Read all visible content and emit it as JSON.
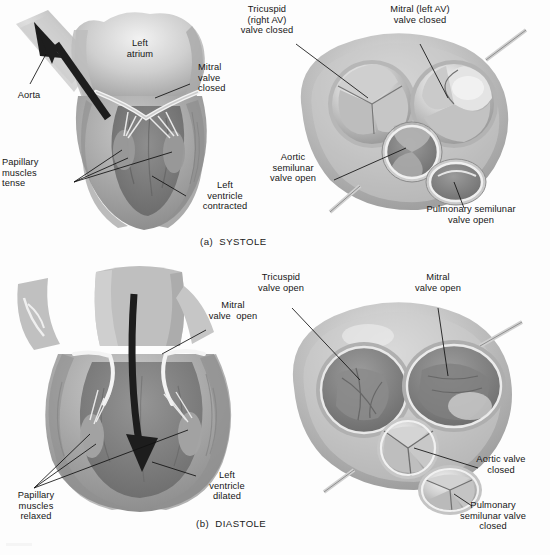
{
  "figure": {
    "title_alt": "Cardiac cycle: systole and diastole with heart valve views",
    "background_color": "#fdfdfd",
    "ink_color": "#161616",
    "tissue_mid": "#9a9a9a",
    "tissue_light": "#d8d8d8",
    "tissue_dark": "#6d6d6d",
    "arrow_color": "#1d1d1d"
  },
  "panels": [
    {
      "id": "systole-longitudinal",
      "caption": "(a)  SYSTOLE",
      "view": "longitudinal-section",
      "labels": [
        {
          "name": "aorta",
          "text": "Aorta"
        },
        {
          "name": "left-atrium",
          "text": "Left\natrium"
        },
        {
          "name": "mitral-valve",
          "text": "Mitral\nvalve\nclosed"
        },
        {
          "name": "papillary-muscles",
          "text": "Papillary\nmuscles\ntense"
        },
        {
          "name": "left-ventricle",
          "text": "Left\nventricle\ncontracted"
        }
      ]
    },
    {
      "id": "systole-valves",
      "view": "superior-valve-section",
      "labels": [
        {
          "name": "tricuspid-valve",
          "text": "Tricuspid\n(right AV)\nvalve closed"
        },
        {
          "name": "mitral-valve",
          "text": "Mitral (left AV)\nvalve closed"
        },
        {
          "name": "aortic-valve",
          "text": "Aortic\nsemilunar\nvalve open"
        },
        {
          "name": "pulmonary-valve",
          "text": "Pulmonary semilunar\nvalve open"
        }
      ]
    },
    {
      "id": "diastole-longitudinal",
      "caption": "(b)  DIASTOLE",
      "view": "longitudinal-section",
      "labels": [
        {
          "name": "mitral-valve",
          "text": "Mitral\nvalve  open"
        },
        {
          "name": "papillary-muscles",
          "text": "Papillary\nmuscles\nrelaxed"
        },
        {
          "name": "left-ventricle",
          "text": "Left\nventricle\ndilated"
        }
      ]
    },
    {
      "id": "diastole-valves",
      "view": "superior-valve-section",
      "labels": [
        {
          "name": "tricuspid-valve",
          "text": "Tricuspid\nvalve open"
        },
        {
          "name": "mitral-valve",
          "text": "Mitral\nvalve open"
        },
        {
          "name": "aortic-valve",
          "text": "Aortic valve\nclosed"
        },
        {
          "name": "pulmonary-valve",
          "text": "Pulmonary\nsemilunar valve\nclosed"
        }
      ]
    }
  ],
  "text": {
    "systole_caption": "(a)  SYSTOLE",
    "diastole_caption": "(b)  DIASTOLE",
    "a_aorta": "Aorta",
    "a_left_atrium_l1": "Left",
    "a_left_atrium_l2": "atrium",
    "a_mitral_l1": "Mitral",
    "a_mitral_l2": "valve",
    "a_mitral_l3": "closed",
    "a_papillary_l1": "Papillary",
    "a_papillary_l2": "muscles",
    "a_papillary_l3": "tense",
    "a_lv_l1": "Left",
    "a_lv_l2": "ventricle",
    "a_lv_l3": "contracted",
    "b_tricuspid_l1": "Tricuspid",
    "b_tricuspid_l2": "(right AV)",
    "b_tricuspid_l3": "valve closed",
    "b_mitral_l1": "Mitral (left AV)",
    "b_mitral_l2": "valve closed",
    "b_aortic_l1": "Aortic",
    "b_aortic_l2": "semilunar",
    "b_aortic_l3": "valve open",
    "b_pulmonary_l1": "Pulmonary semilunar",
    "b_pulmonary_l2": "valve open",
    "c_mitral_l1": "Mitral",
    "c_mitral_l2": "valve  open",
    "c_papillary_l1": "Papillary",
    "c_papillary_l2": "muscles",
    "c_papillary_l3": "relaxed",
    "c_lv_l1": "Left",
    "c_lv_l2": "ventricle",
    "c_lv_l3": "dilated",
    "d_tricuspid_l1": "Tricuspid",
    "d_tricuspid_l2": "valve open",
    "d_mitral_l1": "Mitral",
    "d_mitral_l2": "valve open",
    "d_aortic_l1": "Aortic valve",
    "d_aortic_l2": "closed",
    "d_pulmonary_l1": "Pulmonary",
    "d_pulmonary_l2": "semilunar valve",
    "d_pulmonary_l3": "closed"
  }
}
